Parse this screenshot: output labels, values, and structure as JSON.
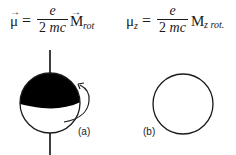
{
  "formulas": {
    "left": {
      "lhs_symbol": "μ",
      "vector_arrow": "→",
      "equals": "=",
      "numerator": "e",
      "denominator_number": "2",
      "denominator_vars": "mc",
      "rhs_symbol": "M",
      "rhs_subscript": "rot"
    },
    "right": {
      "lhs_symbol": "μ",
      "lhs_subscript": "z",
      "equals": "=",
      "numerator": "e",
      "denominator_number": "2",
      "denominator_vars": "mc",
      "rhs_symbol": "M",
      "rhs_subscript": "z rot."
    }
  },
  "diagram": {
    "label_a": "(a)",
    "label_b": "(b)",
    "sphere_a": {
      "cx": 50,
      "cy": 103,
      "r": 30,
      "fill_top": "#000000"
    },
    "circle_b": {
      "cx": 183,
      "cy": 104,
      "r": 31
    }
  }
}
